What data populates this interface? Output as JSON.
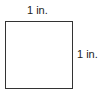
{
  "diagram": {
    "shape": "square",
    "labels": {
      "top": "1 in.",
      "right": "1 in."
    },
    "colors": {
      "stroke": "#333333",
      "fill": "#ffffff",
      "text": "#222222"
    }
  }
}
